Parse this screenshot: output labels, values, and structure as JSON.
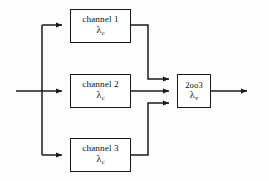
{
  "diagram": {
    "stroke_color": "#1a1a1a",
    "box_fill": "#ffffff",
    "background": "#fdfdfb",
    "nodes": [
      {
        "id": "channel-1",
        "label": "channel 1",
        "rate_symbol": "λ",
        "rate_subscript": "c"
      },
      {
        "id": "channel-2",
        "label": "channel 2",
        "rate_symbol": "λ",
        "rate_subscript": "c"
      },
      {
        "id": "channel-3",
        "label": "channel 3",
        "rate_symbol": "λ",
        "rate_subscript": "c"
      },
      {
        "id": "voter",
        "label": "2oo3",
        "rate_symbol": "λ",
        "rate_subscript": "v"
      }
    ],
    "connections": [
      {
        "id": "input-trunk",
        "from": "input",
        "to": "split-node"
      },
      {
        "id": "split-to-channel-1",
        "from": "split-node",
        "to": "channel-1"
      },
      {
        "id": "split-to-channel-2",
        "from": "split-node",
        "to": "channel-2"
      },
      {
        "id": "split-to-channel-3",
        "from": "split-node",
        "to": "channel-3"
      },
      {
        "id": "channel-1-to-voter",
        "from": "channel-1",
        "to": "voter"
      },
      {
        "id": "channel-2-to-voter",
        "from": "channel-2",
        "to": "voter"
      },
      {
        "id": "channel-3-to-voter",
        "from": "channel-3",
        "to": "voter"
      },
      {
        "id": "voter-to-output",
        "from": "voter",
        "to": "output"
      }
    ]
  }
}
